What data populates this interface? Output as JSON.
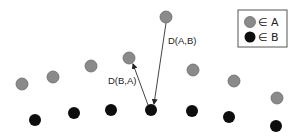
{
  "diagram": {
    "colors": {
      "set_a": "#8a8a8a",
      "set_a_stroke": "#6a6a6a",
      "set_b": "#0d0d0d",
      "arrow": "#444444",
      "legend_border": "#555555"
    },
    "set_a_points": [
      {
        "x": 22,
        "y": 84
      },
      {
        "x": 53,
        "y": 77
      },
      {
        "x": 91,
        "y": 66
      },
      {
        "x": 129,
        "y": 58
      },
      {
        "x": 166,
        "y": 17
      },
      {
        "x": 193,
        "y": 70
      },
      {
        "x": 234,
        "y": 81
      },
      {
        "x": 277,
        "y": 98
      }
    ],
    "set_b_points": [
      {
        "x": 35,
        "y": 120
      },
      {
        "x": 74,
        "y": 113
      },
      {
        "x": 111,
        "y": 110
      },
      {
        "x": 151,
        "y": 110
      },
      {
        "x": 192,
        "y": 111
      },
      {
        "x": 229,
        "y": 117
      },
      {
        "x": 276,
        "y": 126
      }
    ],
    "arrows": [
      {
        "id": "d_ab",
        "label": "D(A,B)",
        "from": {
          "x": 166,
          "y": 23
        },
        "to": {
          "x": 154,
          "y": 104
        }
      },
      {
        "id": "d_ba",
        "label": "D(B,A)",
        "from": {
          "x": 148,
          "y": 105
        },
        "to": {
          "x": 133,
          "y": 64
        }
      }
    ],
    "labels": {
      "d_ab": "D(A,B)",
      "d_ba": "D(B,A)"
    },
    "legend": {
      "items": [
        {
          "label": "∈ A",
          "set": "A"
        },
        {
          "label": "∈ B",
          "set": "B"
        }
      ]
    }
  }
}
